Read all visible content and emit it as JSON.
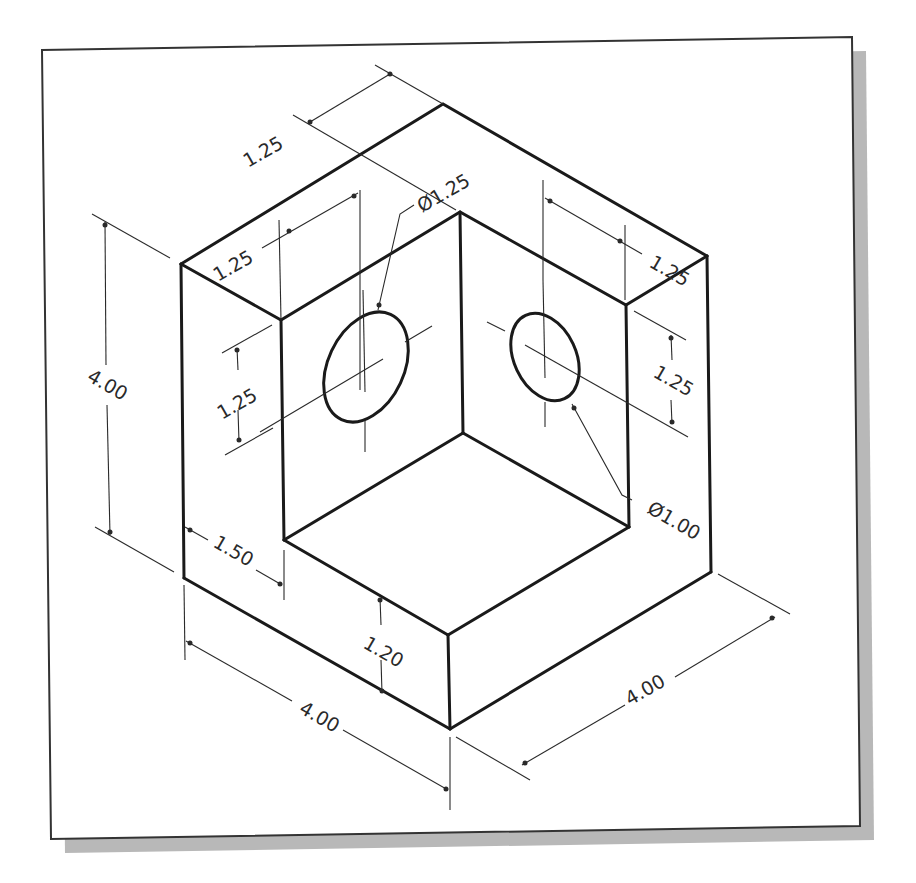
{
  "figure": {
    "type": "isometric-technical-drawing",
    "units": "in"
  },
  "colors": {
    "background": "#ffffff",
    "line": "#1a1a1a",
    "frame_shadow": "#b8b8b8"
  },
  "dimensions": {
    "top_back_depth": "1.25",
    "left_wall_thickness": "1.25",
    "left_hole_diameter": "Ø1.25",
    "right_wall_thickness": "1.25",
    "left_hole_height": "1.25",
    "right_hole_height": "1.25",
    "overall_height": "4.00",
    "right_hole_diameter": "Ø1.00",
    "base_step": "1.50",
    "base_height": "1.20",
    "overall_width_left": "4.00",
    "overall_width_right": "4.00"
  }
}
